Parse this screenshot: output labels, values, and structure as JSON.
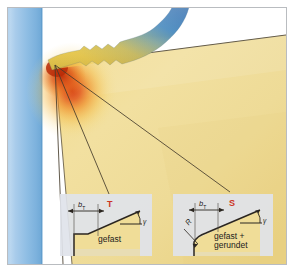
{
  "figure": {
    "domain_kind": "technical-illustration",
    "title_visible": false,
    "frame": {
      "border_color": "#b9bcc0",
      "background": "#ffffff"
    }
  },
  "colors": {
    "workpiece_blue_light": "#cfe4f5",
    "workpiece_blue_mid": "#8dbce0",
    "workpiece_blue_dark": "#6aa7d4",
    "tool_yellow_light": "#f6e7a8",
    "tool_yellow_mid": "#efd98a",
    "tool_yellow_deep": "#e7c964",
    "hotspot_red": "#d8431a",
    "hotspot_orange": "#f09020",
    "chip_blue": "#2f6fb0",
    "chip_yellow": "#f2d04a",
    "label_red": "#cc3322",
    "line_dark": "#3a3226",
    "inset_bg": "#dfe3ea",
    "text_dark": "#1c1c1c"
  },
  "scene": {
    "workpiece": {
      "name": "workpiece",
      "orientation": "vertical-band",
      "description": "blue vertical workpiece band on left edge"
    },
    "tool_body": {
      "name": "cutting-tool-body",
      "description": "yellow wedge-shaped cutting tool occupying right area"
    },
    "chip": {
      "name": "machining-chip",
      "description": "serrated chip curling upward, blue to yellow gradient"
    },
    "hot_zone": {
      "name": "thermal-hot-zone",
      "description": "red-orange radial heat glow at cutting edge"
    },
    "cutting_edge_point": {
      "name": "cutting-edge-origin",
      "x": 47,
      "y": 57
    }
  },
  "leader_lines": [
    {
      "name": "leader-to-inset-T-left",
      "from_x": 47,
      "from_y": 57,
      "to_x": 62,
      "to_y": 260
    },
    {
      "name": "leader-to-inset-T-right",
      "from_x": 47,
      "from_y": 57,
      "to_x": 107,
      "to_y": 192
    },
    {
      "name": "leader-to-inset-S",
      "from_x": 47,
      "from_y": 57,
      "to_x": 228,
      "to_y": 190
    }
  ],
  "insets": [
    {
      "id": "inset-T",
      "name": "detail-inset-chamfered",
      "letter": "T",
      "letter_color": "#cc3322",
      "dimension_label": "b",
      "dimension_subscript": "T",
      "angle_label": "γ",
      "radius_label": null,
      "caption": "gefast",
      "caption_lines": [
        "gefast"
      ],
      "geometry": "chamfered cutting edge, straight bevel"
    },
    {
      "id": "inset-S",
      "name": "detail-inset-chamfered-rounded",
      "letter": "S",
      "letter_color": "#cc3322",
      "dimension_label": "b",
      "dimension_subscript": "T",
      "angle_label": "γ",
      "radius_label": "R",
      "caption": "gefast + gerundet",
      "caption_lines": [
        "gefast +",
        "gerundet"
      ],
      "geometry": "chamfered and rounded cutting edge with radius R"
    }
  ]
}
